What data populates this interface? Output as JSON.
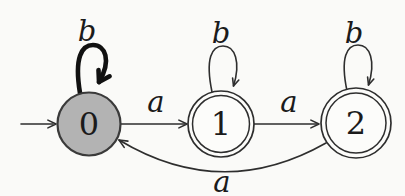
{
  "diagram": {
    "kind": "finite-state-automaton",
    "states": [
      {
        "label": "0",
        "initial": true,
        "accepting": false,
        "shape": "single-circle",
        "fill": "#b3b3b3"
      },
      {
        "label": "1",
        "initial": false,
        "accepting": true,
        "shape": "double-circle",
        "fill": "#fcfcfa"
      },
      {
        "label": "2",
        "initial": false,
        "accepting": true,
        "shape": "double-circle",
        "fill": "#fcfcfa"
      }
    ],
    "transitions": [
      {
        "from": "0",
        "to": "0",
        "label": "b",
        "style": "bold-self-loop"
      },
      {
        "from": "0",
        "to": "1",
        "label": "a",
        "style": "straight"
      },
      {
        "from": "1",
        "to": "1",
        "label": "b",
        "style": "self-loop"
      },
      {
        "from": "1",
        "to": "2",
        "label": "a",
        "style": "straight"
      },
      {
        "from": "2",
        "to": "2",
        "label": "b",
        "style": "self-loop"
      },
      {
        "from": "2",
        "to": "0",
        "label": "a",
        "style": "curved-below"
      }
    ],
    "initial_arrow": {
      "points_to": "0"
    },
    "colors": {
      "background": "#fafaf8",
      "stroke": "#2e2e2e",
      "bold_stroke": "#111111",
      "state0_fill": "#b3b3b3",
      "text": "#1b1b1b"
    }
  }
}
